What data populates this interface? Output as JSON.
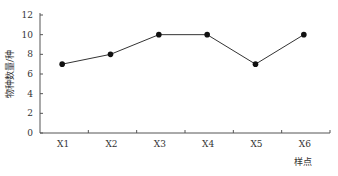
{
  "chart_data": {
    "type": "line",
    "title": "",
    "xlabel": "样点",
    "ylabel": "物种数量/种",
    "categories": [
      "X1",
      "X2",
      "X3",
      "X4",
      "X5",
      "X6"
    ],
    "series": [
      {
        "name": "物种数量",
        "values": [
          7,
          8,
          10,
          10,
          7,
          10
        ],
        "color": "#111111",
        "marker": "circle"
      }
    ],
    "yticks": [
      0,
      2,
      4,
      6,
      8,
      10,
      12
    ],
    "ylim": [
      0,
      12
    ],
    "grid": false,
    "legend": null
  }
}
